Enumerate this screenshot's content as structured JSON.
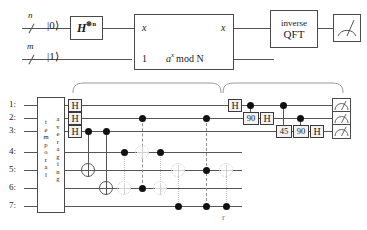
{
  "diagram": {
    "top_circuit": {
      "register_labels": [
        {
          "name": "n-register-size",
          "text": "n"
        },
        {
          "name": "m-register-size",
          "text": "m"
        }
      ],
      "input_states": [
        {
          "name": "ket-zero",
          "text": "|0⟩"
        },
        {
          "name": "ket-one",
          "text": "|1⟩"
        }
      ],
      "hadamard_gate": {
        "label": "H",
        "superscript": "⊗n"
      },
      "oracle_box": {
        "input_top": "x",
        "input_bottom": "1",
        "output_top": "x",
        "output_bottom": "a mod N",
        "output_bottom_base": "a",
        "output_bottom_exp": "x",
        "output_bottom_rest": "mod N"
      },
      "qft_box": {
        "line1": "inverse",
        "line2": "QFT"
      },
      "measurement": {
        "name": "meter-icon",
        "label": "measurement"
      }
    },
    "bottom_circuit": {
      "qubit_labels": [
        "1:",
        "2:",
        "3:",
        "4:",
        "5:",
        "6:",
        "7:"
      ],
      "temporal_box": {
        "word1": "temporal",
        "word2": "averaging"
      },
      "hadamards_left": [
        {
          "qubit": 1,
          "label": "H"
        },
        {
          "qubit": 2,
          "label": "H"
        },
        {
          "qubit": 3,
          "label": "H"
        }
      ],
      "qft_gates": [
        {
          "qubit": 1,
          "label": "H"
        },
        {
          "qubit": 2,
          "label": "90"
        },
        {
          "qubit": 2,
          "label": "H"
        },
        {
          "qubit": 3,
          "label": "45"
        },
        {
          "qubit": 3,
          "label": "90"
        },
        {
          "qubit": 3,
          "label": "H"
        }
      ],
      "measurements": [
        {
          "qubit": 1,
          "name": "meter-icon"
        },
        {
          "qubit": 2,
          "name": "meter-icon"
        },
        {
          "qubit": 3,
          "name": "meter-icon"
        }
      ],
      "annotation_below": "r",
      "brace_count": 2
    }
  },
  "colors": {
    "wire": "#555555",
    "ink": "#1a1a1a",
    "gate_fill": "#f2f2f2",
    "gate_border": "#3a3a3a",
    "faint": "#cfcfcf",
    "dashed": "#8d8d8d"
  }
}
